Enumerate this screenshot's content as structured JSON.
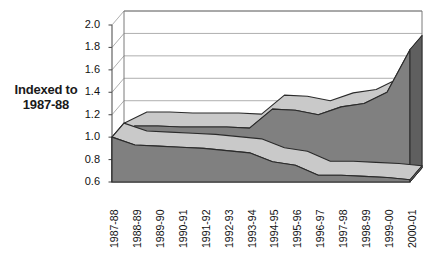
{
  "chart_data": {
    "type": "area",
    "title": "",
    "xlabel": "",
    "ylabel": "Indexed to 1987-88",
    "ylim": [
      0.6,
      2.0
    ],
    "ytick_step": 0.2,
    "yticks": [
      "2.0",
      "1.8",
      "1.6",
      "1.4",
      "1.2",
      "1.0",
      "0.8",
      "0.6"
    ],
    "grid": true,
    "legend": "none",
    "three_d": true,
    "categories": [
      "1987-88",
      "1988-89",
      "1989-90",
      "1990-91",
      "1991-92",
      "1992-93",
      "1993-94",
      "1994-95",
      "1995-96",
      "1996-97",
      "1997-98",
      "1998-99",
      "1999-00",
      "2000-01"
    ],
    "series": [
      {
        "name": "upper-series",
        "color": "#808080",
        "values": [
          1.0,
          1.1,
          1.1,
          1.09,
          1.09,
          1.09,
          1.08,
          1.25,
          1.24,
          1.2,
          1.27,
          1.3,
          1.4,
          1.78
        ]
      },
      {
        "name": "lower-series",
        "color": "#808080",
        "values": [
          1.0,
          0.93,
          0.92,
          0.91,
          0.9,
          0.88,
          0.86,
          0.78,
          0.75,
          0.66,
          0.66,
          0.65,
          0.64,
          0.62
        ]
      }
    ]
  },
  "axis": {
    "y_label_line1": "Indexed to",
    "y_label_line2": "1987-88"
  },
  "colors": {
    "series_fill": "#808080",
    "series_fill_dark": "#6e6e6e",
    "series_edge": "#2b2b2b",
    "plot_floor": "#ffffff",
    "gridline": "#9a9a9a",
    "axis_line": "#555555",
    "text": "#111111"
  }
}
